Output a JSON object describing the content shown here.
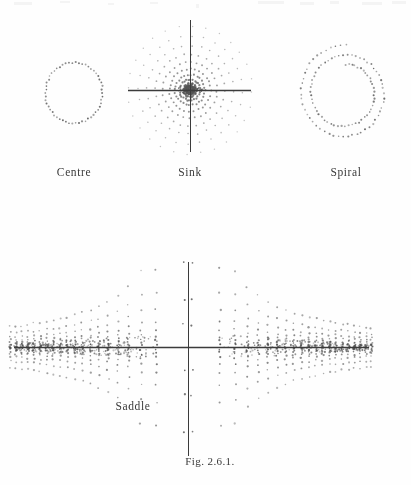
{
  "page": {
    "background_color": "#fefefe",
    "ink_color": "#2b2b2b",
    "axis_color": "#3b3b3b",
    "dot_color": "#555555",
    "width": 411,
    "height": 485
  },
  "caption": {
    "text": "Fig. 2.6.1."
  },
  "panels": [
    {
      "id": "centre",
      "label": "Centre",
      "label_x": 74,
      "label_y": 175,
      "has_axes": false,
      "center": [
        74,
        93
      ],
      "description": "closed dotted circular orbit"
    },
    {
      "id": "sink",
      "label": "Sink",
      "label_x": 190,
      "label_y": 175,
      "has_axes": true,
      "center": [
        190,
        90
      ],
      "axis_x": [
        128,
        251
      ],
      "axis_y": [
        20,
        152
      ],
      "description": "radial dotted rays converging to the origin"
    },
    {
      "id": "spiral",
      "label": "Spiral",
      "label_x": 346,
      "label_y": 175,
      "has_axes": false,
      "center": [
        345,
        93
      ],
      "description": "dotted spiral with about two turns"
    },
    {
      "id": "saddle",
      "label": "Saddle",
      "label_x": 133,
      "label_y": 409,
      "has_axes": true,
      "center": [
        188,
        347
      ],
      "axis_x": [
        14,
        369
      ],
      "axis_y": [
        262,
        456
      ],
      "description": "hyperbolic dotted trajectories in four quadrants"
    }
  ],
  "chart_data": {
    "type": "scatter",
    "title": "Fig. 2.6.1.",
    "xlabel": "",
    "ylabel": "",
    "grid": false,
    "legend_position": "none",
    "panel_titles": [
      "Centre",
      "Sink",
      "Spiral",
      "Saddle"
    ],
    "series": [
      {
        "name": "Centre",
        "kind": "closed-orbit",
        "center": [
          74,
          93
        ],
        "radius": 28,
        "n_dots": 54,
        "phase_portrait": "centre",
        "axes_shown": false
      },
      {
        "name": "Sink",
        "kind": "radial-rays",
        "center": [
          190,
          90
        ],
        "n_rays": 28,
        "dots_per_ray": 11,
        "r_min": 3,
        "r_max": 62,
        "phase_portrait": "stable node (sink)",
        "axes_shown": true,
        "xlim": [
          128,
          251
        ],
        "ylim": [
          20,
          152
        ]
      },
      {
        "name": "Spiral",
        "kind": "logarithmic-spiral",
        "center": [
          345,
          93
        ],
        "turns": 2,
        "r_start": 27,
        "r_end": 46,
        "n_dots": 110,
        "phase_portrait": "spiral (focus)",
        "axes_shown": false
      },
      {
        "name": "Saddle",
        "kind": "hyperbolas",
        "center": [
          188,
          347
        ],
        "n_curves": 18,
        "dots_per_curve": 22,
        "phase_portrait": "saddle",
        "axes_shown": true,
        "xlim": [
          14,
          369
        ],
        "ylim": [
          262,
          456
        ]
      }
    ]
  }
}
